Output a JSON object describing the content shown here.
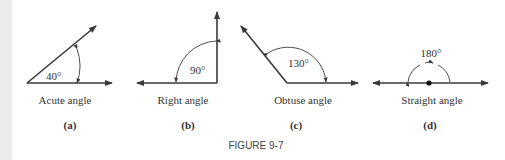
{
  "figure": {
    "caption": "FIGURE 9-7",
    "panels": [
      {
        "id": "a",
        "name": "Acute angle",
        "label": "(a)",
        "measure": "40°",
        "degrees": 40
      },
      {
        "id": "b",
        "name": "Right angle",
        "label": "(b)",
        "measure": "90°",
        "degrees": 90
      },
      {
        "id": "c",
        "name": "Obtuse angle",
        "label": "(c)",
        "measure": "130°",
        "degrees": 130
      },
      {
        "id": "d",
        "name": "Straight angle",
        "label": "(d)",
        "measure": "180°",
        "degrees": 180
      }
    ]
  },
  "colors": {
    "line": "#3a3a3a",
    "text": "#333333",
    "strip": "#ececec"
  }
}
